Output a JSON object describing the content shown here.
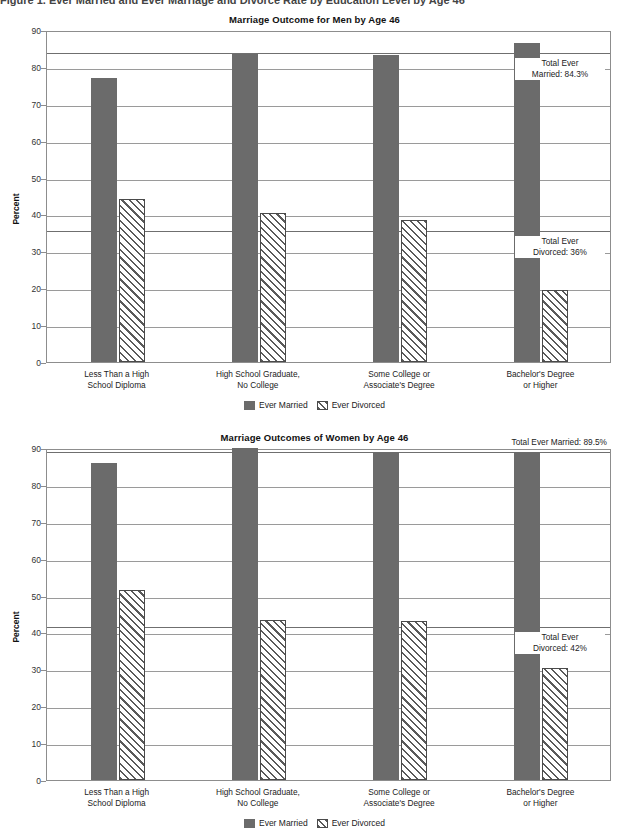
{
  "figure": {
    "caption": "Figure 1.  Ever Married and Ever Marriage and Divorce Rate by Education Level by Age 46"
  },
  "legend": {
    "married_label": "Ever Married",
    "divorced_label": "Ever Divorced"
  },
  "axis": {
    "ylabel": "Percent",
    "ticks": [
      "0",
      "10",
      "20",
      "30",
      "40",
      "50",
      "60",
      "70",
      "80",
      "90"
    ]
  },
  "colors": {
    "married": "#6b6b6b",
    "divorced_outline": "#4a4a4a",
    "gridline": "#9a9a9a",
    "refline": "#6f6f6f"
  },
  "chart_data": [
    {
      "type": "bar",
      "id": "men",
      "title": "Marriage Outcome for Men by Age 46",
      "xlabel": "",
      "ylabel": "Percent",
      "ylim": [
        0,
        90
      ],
      "ytick_step": 10,
      "grid": true,
      "legend_position": "bottom",
      "categories": [
        "Less Than a High\nSchool Diploma",
        "High School Graduate,\nNo College",
        "Some College or\nAssociate's Degree",
        "Bachelor's Degree\nor Higher"
      ],
      "series": [
        {
          "name": "Ever Married",
          "values": [
            77.0,
            83.5,
            83.3,
            86.5
          ]
        },
        {
          "name": "Ever Divorced",
          "values": [
            44.2,
            40.5,
            38.4,
            19.5
          ]
        }
      ],
      "reference_lines": [
        {
          "value": 84.3,
          "label": "Total Ever\nMarried: 84.3%"
        },
        {
          "value": 36.0,
          "label": "Total Ever\nDivorced: 36%"
        }
      ]
    },
    {
      "type": "bar",
      "id": "women",
      "title": "Marriage Outcomes of Women by Age 46",
      "xlabel": "",
      "ylabel": "Percent",
      "ylim": [
        0,
        90
      ],
      "ytick_step": 10,
      "grid": true,
      "legend_position": "bottom",
      "categories": [
        "Less Than a High\nSchool Diploma",
        "High School Graduate,\nNo College",
        "Some College or\nAssociate's Degree",
        "Bachelor's Degree\nor Higher"
      ],
      "series": [
        {
          "name": "Ever Married",
          "values": [
            86.0,
            89.9,
            88.8,
            88.9
          ]
        },
        {
          "name": "Ever Divorced",
          "values": [
            51.5,
            43.5,
            43.2,
            30.4
          ]
        }
      ],
      "reference_lines": [
        {
          "value": 89.5,
          "label": "Total Ever Married: 89.5%",
          "align": "right-top"
        },
        {
          "value": 42.0,
          "label": "Total Ever\nDivorced: 42%"
        }
      ]
    }
  ]
}
